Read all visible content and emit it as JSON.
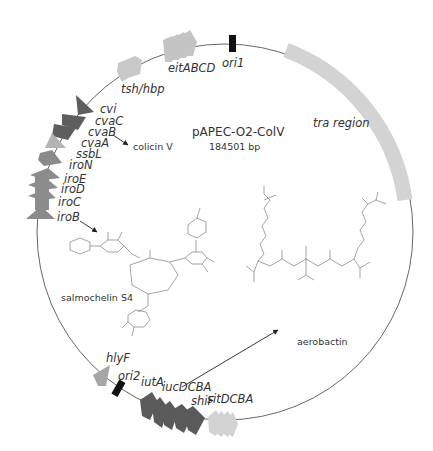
{
  "plasmid": {
    "name": "pAPEC-O2-ColV",
    "size": "184501 bp"
  },
  "colors": {
    "backbone": "#555555",
    "light_gray": "#cfcfcf",
    "medium_gray": "#9a9a9a",
    "dark_gray": "#5e5e5e",
    "ori": "#111111",
    "arrow": "#222222"
  },
  "features": [
    {
      "label": "ori1",
      "type": "origin"
    },
    {
      "label": "tra region",
      "type": "region"
    },
    {
      "label": "eitABCD",
      "type": "gene-cluster"
    },
    {
      "label": "tsh/hbp",
      "type": "gene"
    },
    {
      "label": "cvi",
      "type": "gene"
    },
    {
      "label": "cvaC",
      "type": "gene"
    },
    {
      "label": "cvaB",
      "type": "gene"
    },
    {
      "label": "cvaA",
      "type": "gene"
    },
    {
      "label": "ssbL",
      "type": "gene"
    },
    {
      "label": "iroN",
      "type": "gene"
    },
    {
      "label": "iroE",
      "type": "gene"
    },
    {
      "label": "iroD",
      "type": "gene"
    },
    {
      "label": "iroC",
      "type": "gene"
    },
    {
      "label": "iroB",
      "type": "gene"
    },
    {
      "label": "hlyF",
      "type": "gene"
    },
    {
      "label": "ori2",
      "type": "origin"
    },
    {
      "label": "iutA",
      "type": "gene"
    },
    {
      "label": "iucDCBA",
      "type": "gene-cluster"
    },
    {
      "label": "shiF",
      "type": "gene"
    },
    {
      "label": "sitDCBA",
      "type": "gene-cluster"
    }
  ],
  "products": {
    "colicin": "colicin V",
    "salmochelin": "salmochelin S4",
    "aerobactin": "aerobactin"
  }
}
